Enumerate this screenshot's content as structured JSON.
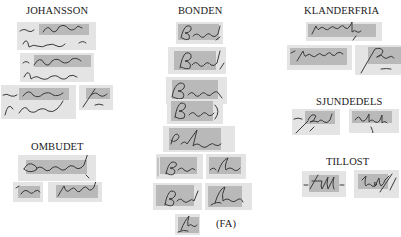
{
  "figure": {
    "groups": [
      {
        "label": "JOHANSSON",
        "crops": [
          {
            "word": "Johansson",
            "context": "Hustru Johansson"
          },
          {
            "word": "Johansson",
            "context": "Hustrun Johansson"
          },
          {
            "word": "Johansson",
            "context": "Johansson"
          },
          {
            "word": "Johansson",
            "context": "fragment"
          }
        ]
      },
      {
        "label": "OMBUDET",
        "crops": [
          {
            "word": "Ombudet"
          },
          {
            "word": "Om"
          },
          {
            "word": "budet"
          }
        ]
      },
      {
        "label": "BONDEN",
        "crops": [
          {
            "word": "Bonden"
          },
          {
            "word": "Bonden"
          },
          {
            "word": "Bonden"
          },
          {
            "word": "Bonden"
          },
          {
            "word": "Bonden"
          },
          {
            "word": "Bon"
          },
          {
            "word": "den"
          },
          {
            "word": "Bon"
          },
          {
            "word": "den"
          },
          {
            "word": "den",
            "annotation": "(FA)"
          }
        ]
      },
      {
        "label": "KLANDERFRIA",
        "crops": [
          {
            "word": "klanderfria"
          },
          {
            "word": "klander"
          },
          {
            "word": "fria"
          }
        ]
      },
      {
        "label": "SJUNDEDELS",
        "crops": [
          {
            "word": "sjunde"
          },
          {
            "word": "dels"
          }
        ]
      },
      {
        "label": "TILLOST",
        "crops": [
          {
            "word": "till"
          },
          {
            "word": "löst"
          }
        ]
      }
    ],
    "fa_label": "(FA)"
  }
}
